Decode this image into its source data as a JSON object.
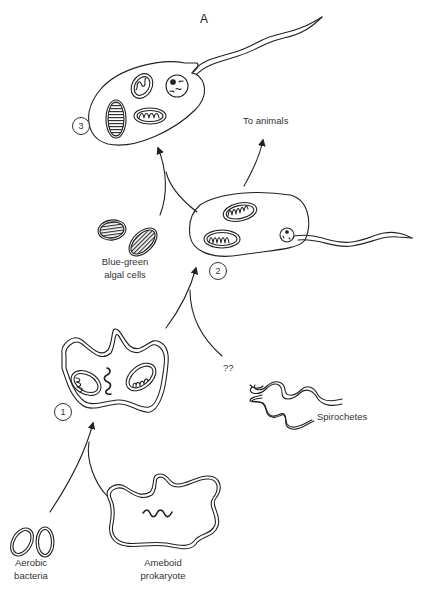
{
  "diagram": {
    "title": "A",
    "stages": [
      {
        "number": "1",
        "description": "Ameboid prokaryote engulfs aerobic bacteria (mitochondria)"
      },
      {
        "number": "2",
        "description": "Flagellated eukaryotic cell with mitochondria and nucleus"
      },
      {
        "number": "3",
        "description": "Cell additionally acquires blue-green algal cells (chloroplasts)"
      }
    ],
    "labels": {
      "aerobic_bacteria_line1": "Aerobic",
      "aerobic_bacteria_line2": "bacteria",
      "ameboid_line1": "Ameboid",
      "ameboid_line2": "prokaryote",
      "spirochetes": "Spirochetes",
      "unknown": "??",
      "algae_line1": "Blue-green",
      "algae_line2": "algal cells",
      "to_animals": "To animals"
    },
    "arrows": [
      {
        "from": [
          "Aerobic bacteria",
          "Ameboid prokaryote"
        ],
        "to": "1"
      },
      {
        "from": [
          "1",
          "Spirochetes (??)"
        ],
        "to": "2"
      },
      {
        "from": [
          "2",
          "Blue-green algal cells"
        ],
        "to": "3"
      },
      {
        "from": [
          "2"
        ],
        "to": "To animals"
      }
    ],
    "colors": {
      "line": "#222222",
      "background": "#ffffff"
    }
  }
}
